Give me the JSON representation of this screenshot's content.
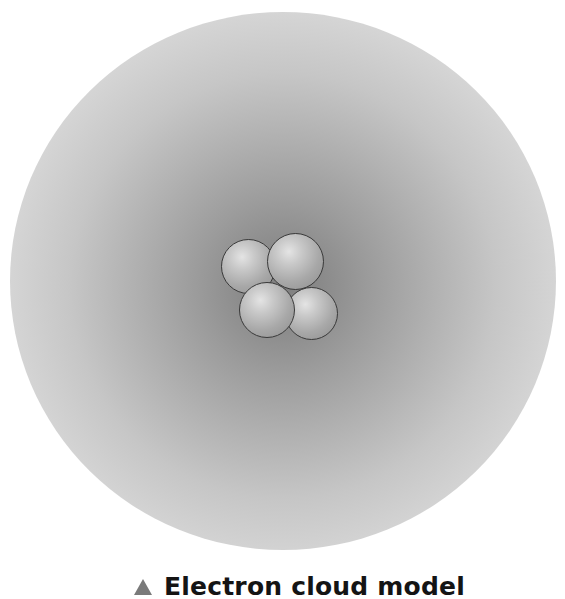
{
  "figure": {
    "nucleus_particle_count": 4,
    "colors": {
      "cloud_center": "#7f7f7f",
      "cloud_edge": "#e6e6e6",
      "particle_highlight": "#e4e4e4",
      "particle_shadow": "#8e8e8e",
      "particle_outline": "#3a3a3a",
      "caption_marker": "#7a7a7a",
      "caption_text": "#141414"
    }
  },
  "caption": {
    "marker_icon": "triangle-up-icon",
    "text": "Electron cloud model"
  }
}
